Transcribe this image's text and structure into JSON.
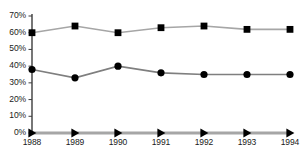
{
  "chart_data": {
    "type": "line",
    "title": "",
    "subtitle": "",
    "xlabel": "",
    "ylabel": "",
    "categories": [
      "1988",
      "1989",
      "1990",
      "1991",
      "1992",
      "1993",
      "1994"
    ],
    "x": [
      1988,
      1989,
      1990,
      1991,
      1992,
      1993,
      1994
    ],
    "ylim": [
      0,
      70
    ],
    "yticks": [
      0,
      10,
      20,
      30,
      40,
      50,
      60,
      70
    ],
    "ytick_labels": [
      "0%",
      "10%",
      "20%",
      "30%",
      "40%",
      "50%",
      "60%",
      "70%"
    ],
    "grid": false,
    "legend": "none",
    "series": [
      {
        "name": "series-squares",
        "marker": "square",
        "marker_color": "#000000",
        "line_color": "#a6a6a6",
        "values": [
          60,
          64,
          60,
          63,
          64,
          62,
          62
        ]
      },
      {
        "name": "series-circles",
        "marker": "circle",
        "marker_color": "#000000",
        "line_color": "#7f7f7f",
        "values": [
          38,
          33,
          40,
          36,
          35,
          35,
          35
        ]
      },
      {
        "name": "series-triangles",
        "marker": "triangle-right",
        "marker_color": "#000000",
        "line_color": "#a6a6a6",
        "values": [
          0,
          0,
          0,
          0,
          0,
          0,
          0
        ]
      }
    ],
    "axis_color": "#3d3d3d"
  }
}
